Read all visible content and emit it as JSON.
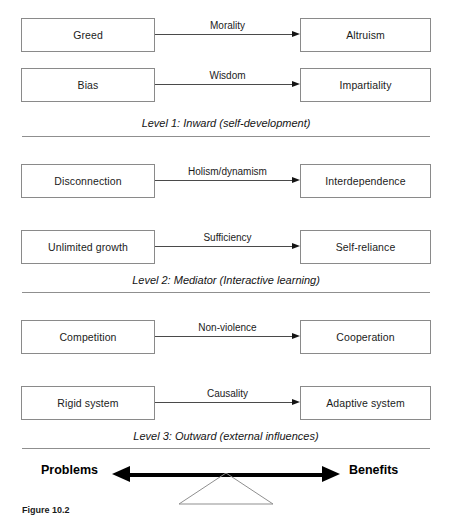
{
  "diagram": {
    "box_border_color": "#8a8a8a",
    "arrow_color": "#141414",
    "levels": [
      {
        "id": "level-1",
        "label": "Level 1: Inward (self-development)",
        "rows": [
          {
            "source": "Greed",
            "mediator": "Morality",
            "target": "Altruism"
          },
          {
            "source": "Bias",
            "mediator": "Wisdom",
            "target": "Impartiality"
          }
        ]
      },
      {
        "id": "level-2",
        "label": "Level 2: Mediator (Interactive learning)",
        "rows": [
          {
            "source": "Disconnection",
            "mediator": "Holism/dynamism",
            "target": "Interdependence"
          },
          {
            "source": "Unlimited growth",
            "mediator": "Sufficiency",
            "target": "Self-reliance"
          }
        ]
      },
      {
        "id": "level-3",
        "label": "Level 3: Outward (external influences)",
        "rows": [
          {
            "source": "Competition",
            "mediator": "Non-violence",
            "target": "Cooperation"
          },
          {
            "source": "Rigid system",
            "mediator": "Causality",
            "target": "Adaptive system"
          }
        ]
      }
    ]
  },
  "balance": {
    "left_label": "Problems",
    "right_label": "Benefits"
  },
  "caption": {
    "number": "Figure 10.2",
    "text": ""
  }
}
